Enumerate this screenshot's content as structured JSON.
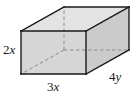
{
  "figure": {
    "type": "rectangular-prism",
    "colors": {
      "background": "#ffffff",
      "front_face": "#d4d4d4",
      "top_face": "#e2e2e2",
      "right_face": "#cccccc",
      "visible_edge": "#1a1a1a",
      "hidden_edge": "#8a8a8a",
      "label_text": "#1a1a1a"
    },
    "labels": {
      "height": {
        "coefficient": "2",
        "variable": "x",
        "full": "2x",
        "position": "left of front face vertical edge"
      },
      "width": {
        "coefficient": "3",
        "variable": "x",
        "full": "3x",
        "position": "below front face bottom edge"
      },
      "depth": {
        "coefficient": "4",
        "variable": "y",
        "full": "4y",
        "position": "along lower right receding edge"
      }
    },
    "geometry": {
      "front_face": {
        "top_left": [
          21,
          31
        ],
        "top_right": [
          86,
          31
        ],
        "bottom_right": [
          86,
          74
        ],
        "bottom_left": [
          21,
          74
        ]
      },
      "depth_offset": [
        43,
        -24
      ],
      "back_face": {
        "top_left": [
          64,
          7
        ],
        "top_right": [
          129,
          7
        ],
        "bottom_right": [
          129,
          50
        ],
        "bottom_left": [
          64,
          50
        ]
      },
      "hidden_vertex": [
        64,
        50
      ]
    }
  }
}
